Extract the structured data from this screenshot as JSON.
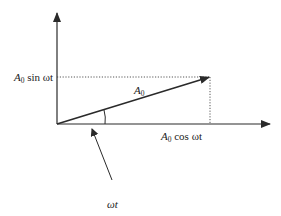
{
  "diagram": {
    "colors": {
      "stroke": "#2a2a2a",
      "background": "#ffffff"
    },
    "origin": {
      "x": 57,
      "y": 124
    },
    "axes": {
      "x_axis_end": {
        "x": 271,
        "y": 124
      },
      "y_axis_end": {
        "x": 57,
        "y": 12
      }
    },
    "phasor": {
      "label": "A",
      "label_sub": "0",
      "tip": {
        "x": 210,
        "y": 77
      }
    },
    "projections": {
      "vertical": {
        "label_amp": "A",
        "label_sub": "0",
        "label_rest": " sin ωt",
        "y": 77
      },
      "horizontal": {
        "label_amp": "A",
        "label_sub": "0",
        "label_rest": " cos ωt",
        "x": 210
      }
    },
    "angle": {
      "label": "ωt",
      "arc_x": 105,
      "pointer_from": {
        "x": 112,
        "y": 180
      },
      "pointer_to": {
        "x": 91,
        "y": 127
      }
    }
  }
}
